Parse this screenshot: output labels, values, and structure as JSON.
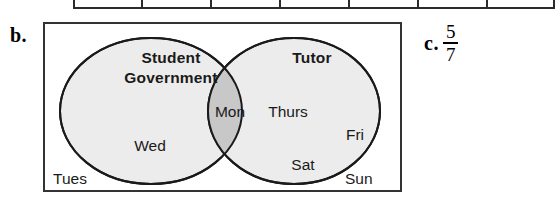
{
  "page": {
    "background_color": "#ffffff",
    "ink_color": "#1a1a1a"
  },
  "table_remnant": {
    "description": "bottom edge of a cut-off table above the figure",
    "column_divider_count": 7
  },
  "item_b": {
    "label": "b.",
    "figure_type": "venn-diagram",
    "frame": {
      "border_color": "#333333",
      "fill_color": "#ffffff"
    },
    "venn": {
      "left_set": {
        "title_line1": "Student",
        "title_line2": "Government",
        "fill_color": "#ececec",
        "stroke_color": "#1a1a1a",
        "members_only": [
          "Wed"
        ]
      },
      "right_set": {
        "title": "Tutor",
        "fill_color": "#ececec",
        "stroke_color": "#1a1a1a",
        "members_only": [
          "Thurs",
          "Fri",
          "Sat"
        ]
      },
      "intersection": {
        "fill_color": "#c8c8c8",
        "members": [
          "Mon"
        ]
      },
      "outside": {
        "members": [
          "Tues",
          "Sun"
        ]
      },
      "labels": {
        "student": "Student",
        "government": "Government",
        "tutor": "Tutor",
        "mon": "Mon",
        "wed": "Wed",
        "thurs": "Thurs",
        "fri": "Fri",
        "sat": "Sat",
        "tues": "Tues",
        "sun": "Sun"
      }
    }
  },
  "item_c": {
    "label": "c.",
    "answer": {
      "type": "fraction",
      "numerator": "5",
      "denominator": "7",
      "value_text": "5/7"
    }
  }
}
